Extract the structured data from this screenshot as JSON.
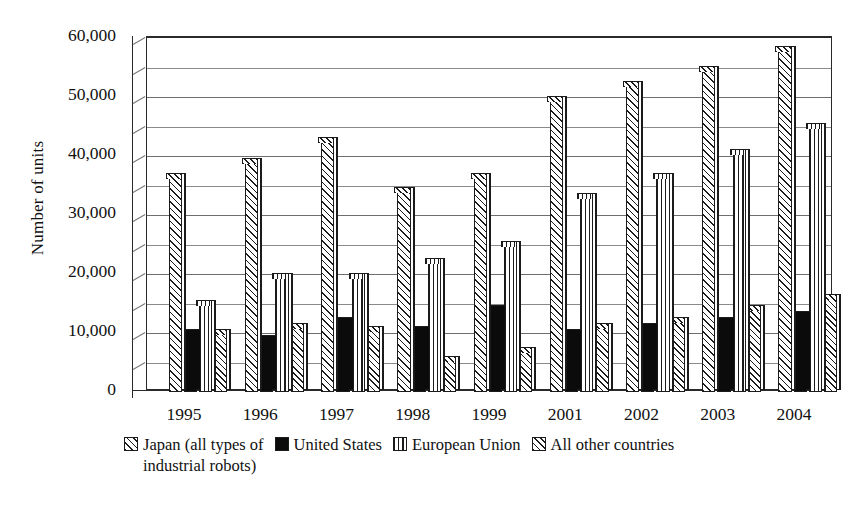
{
  "chart_data": {
    "type": "bar",
    "title": "",
    "subtitle": "",
    "xlabel": "",
    "ylabel": "Number of units",
    "categories": [
      "1995",
      "1996",
      "1997",
      "1998",
      "1999",
      "2001",
      "2002",
      "2003",
      "2004"
    ],
    "ylim": [
      0,
      60000
    ],
    "ytick_values": [
      0,
      10000,
      20000,
      30000,
      40000,
      50000,
      60000
    ],
    "ytick_labels": [
      "0",
      "10,000",
      "20,000",
      "30,000",
      "40,000",
      "50,000",
      "60,000"
    ],
    "minor_tick_step": 5000,
    "grid": true,
    "grid_axis": "y",
    "legend_position": "bottom",
    "style": "3d-bar-monochrome-hatched",
    "series": [
      {
        "name": "Japan (all types of industrial robots)",
        "pattern": "diagonal-hatch",
        "color": "#ffffff",
        "values": [
          36500,
          39000,
          42500,
          34000,
          36500,
          49500,
          52000,
          54500,
          58000
        ]
      },
      {
        "name": "United States",
        "pattern": "solid-black",
        "color": "#0b0b0b",
        "values": [
          10000,
          9000,
          12000,
          10500,
          14000,
          10000,
          11000,
          12000,
          13000
        ]
      },
      {
        "name": "European Union",
        "pattern": "vertical-lines",
        "color": "#ffffff",
        "values": [
          15000,
          19500,
          19500,
          22000,
          25000,
          33000,
          36500,
          40500,
          45000
        ]
      },
      {
        "name": "All other countries",
        "pattern": "crosshatch",
        "color": "#ffffff",
        "values": [
          10000,
          11000,
          10500,
          5500,
          7000,
          11000,
          12000,
          14000,
          16000
        ]
      }
    ]
  },
  "legend": {
    "items": [
      {
        "label": "Japan (all types of",
        "swatch": "diagonal-hatch-swatch"
      },
      {
        "label": "United States",
        "swatch": "solid-black-swatch"
      },
      {
        "label": "European Union",
        "swatch": "vertical-lines-swatch"
      },
      {
        "label": "All other countries",
        "swatch": "crosshatch-swatch"
      }
    ],
    "continuation": "industrial robots)"
  }
}
